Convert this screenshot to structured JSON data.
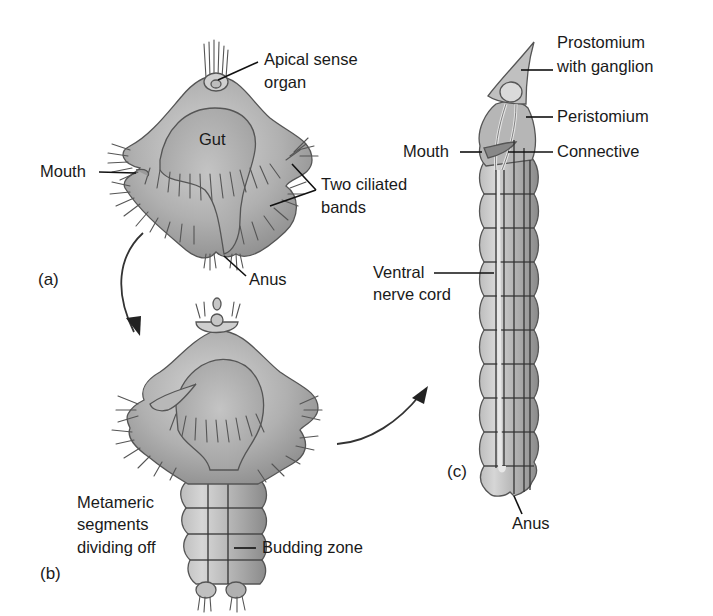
{
  "figure": {
    "panels": [
      {
        "id": "a",
        "label": "(a)"
      },
      {
        "id": "b",
        "label": "(b)"
      },
      {
        "id": "c",
        "label": "(c)"
      }
    ],
    "labels": {
      "a": {
        "apical_1": "Apical sense",
        "apical_2": "organ",
        "gut": "Gut",
        "mouth": "Mouth",
        "ciliated_1": "Two ciliated",
        "ciliated_2": "bands",
        "anus": "Anus"
      },
      "b": {
        "metameric_1": "Metameric",
        "metameric_2": "segments",
        "metameric_3": "dividing off",
        "budding": "Budding zone"
      },
      "c": {
        "prostomium_1": "Prostomium",
        "prostomium_2": "with ganglion",
        "peristomium": "Peristomium",
        "mouth": "Mouth",
        "connective": "Connective",
        "ventral_1": "Ventral",
        "ventral_2": "nerve cord",
        "anus": "Anus"
      }
    },
    "colors": {
      "background": "#ffffff",
      "body_light": "#c9c9c9",
      "body_mid": "#a8a8a8",
      "body_dark": "#8c8c8c",
      "text": "#1a1a1a"
    }
  }
}
